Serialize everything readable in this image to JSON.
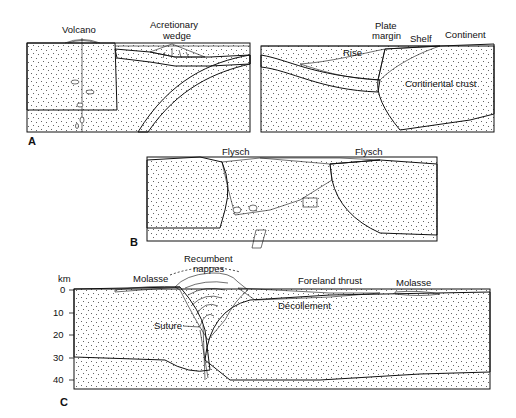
{
  "figure": {
    "colors": {
      "ink": "#111111",
      "background": "#ffffff"
    }
  },
  "panels": {
    "A": {
      "letter": "A",
      "labels": {
        "volcano": "Volcano",
        "accretionary_wedge_1": "Acretionary",
        "accretionary_wedge_2": "wedge",
        "plate_margin_1": "Plate",
        "plate_margin_2": "margin",
        "shelf": "Shelf",
        "continent": "Continent",
        "rise": "Rise",
        "continental_crust": "Continental crust"
      }
    },
    "B": {
      "letter": "B",
      "labels": {
        "flysch_left": "Flysch",
        "flysch_right": "Flysch"
      }
    },
    "C": {
      "letter": "C",
      "labels": {
        "recumbent_1": "Recumbent",
        "recumbent_2": "nappes",
        "molasse_left": "Molasse",
        "foreland_thrust": "Foreland thrust",
        "molasse_right": "Molasse",
        "decollement": "Décollement",
        "suture": "Suture"
      },
      "depth_axis": {
        "unit": "km",
        "ticks": [
          "0",
          "10",
          "20",
          "30",
          "40"
        ]
      }
    }
  }
}
